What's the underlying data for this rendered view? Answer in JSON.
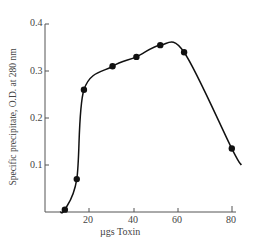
{
  "chart_data": {
    "type": "line",
    "title": "",
    "xlabel": "µgs Toxin",
    "ylabel": "Specific precipitate, O.D. at 280 nm",
    "x_ticks": [
      "20",
      "40",
      "60",
      "80"
    ],
    "y_ticks": [
      "0.1",
      "0.2",
      "0.3",
      "0.4"
    ],
    "xlim": [
      0,
      85
    ],
    "ylim": [
      0,
      0.4
    ],
    "grid": false,
    "legend": null,
    "series": [
      {
        "name": "Specific precipitate",
        "x": [
          10,
          15,
          18,
          30,
          40,
          50,
          60,
          80
        ],
        "y": [
          0.005,
          0.07,
          0.26,
          0.31,
          0.33,
          0.355,
          0.34,
          0.135
        ]
      }
    ]
  }
}
